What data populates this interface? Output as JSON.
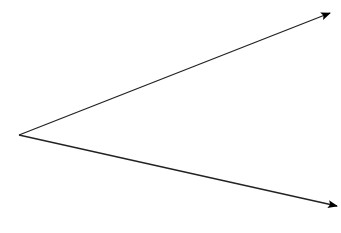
{
  "diagram": {
    "vertex": [
      19,
      135
    ],
    "rays": [
      {
        "name": "upper-ray",
        "end": [
          330,
          13
        ]
      },
      {
        "name": "lower-ray",
        "end": [
          337,
          206
        ]
      }
    ],
    "stroke_color": "#222222",
    "arrow_color": "#000000"
  }
}
